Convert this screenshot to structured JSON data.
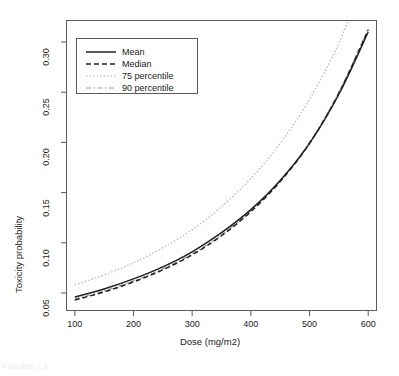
{
  "figure": {
    "caption": "FIGURE 7.1"
  },
  "chart_data": {
    "type": "line",
    "title": "",
    "xlabel": "Dose (mg/m2)",
    "ylabel": "Toxicity probability",
    "xlim": [
      85,
      615
    ],
    "ylim": [
      0.032,
      0.322
    ],
    "xticks": [
      100,
      200,
      300,
      400,
      500,
      600
    ],
    "xtick_labels": [
      "100",
      "200",
      "300",
      "400",
      "500",
      "600"
    ],
    "yticks": [
      0.05,
      0.1,
      0.15,
      0.2,
      0.25,
      0.3
    ],
    "ytick_labels": [
      "0.05",
      "0.10",
      "0.15",
      "0.20",
      "0.25",
      "0.30"
    ],
    "grid": false,
    "legend_position": "upper left",
    "x": [
      100,
      150,
      200,
      250,
      300,
      350,
      400,
      450,
      500,
      550,
      600
    ],
    "series": [
      {
        "name": "Mean",
        "style": "solid",
        "color": "#222222",
        "width": 1.5,
        "values": [
          0.046,
          0.054,
          0.064,
          0.076,
          0.091,
          0.11,
          0.133,
          0.162,
          0.199,
          0.248,
          0.31
        ]
      },
      {
        "name": "Median",
        "style": "dashed",
        "color": "#222222",
        "width": 1.5,
        "values": [
          0.043,
          0.051,
          0.061,
          0.073,
          0.088,
          0.107,
          0.131,
          0.161,
          0.199,
          0.249,
          0.312
        ]
      },
      {
        "name": "75 percentile",
        "style": "dotted",
        "color": "#b4b4b4",
        "width": 1.2,
        "values": [
          0.058,
          0.068,
          0.08,
          0.095,
          0.113,
          0.136,
          0.164,
          0.199,
          0.243,
          0.299,
          0.372
        ]
      },
      {
        "name": "90 percentile",
        "style": "dashdot",
        "color": "#9a9a9a",
        "width": 1.2,
        "values": [
          0.044,
          0.052,
          0.062,
          0.074,
          0.089,
          0.108,
          0.132,
          0.162,
          0.2,
          0.25,
          0.313
        ]
      }
    ]
  },
  "legend": {
    "items": [
      {
        "label": "Mean"
      },
      {
        "label": "Median"
      },
      {
        "label": "75 percentile"
      },
      {
        "label": "90 percentile"
      }
    ]
  }
}
